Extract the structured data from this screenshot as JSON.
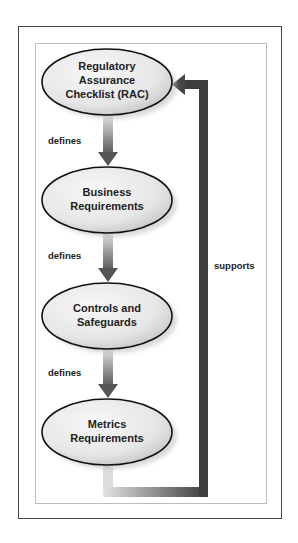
{
  "diagram": {
    "nodes": [
      {
        "id": "rac",
        "lines": [
          "Regulatory",
          "Assurance",
          "Checklist (RAC)"
        ]
      },
      {
        "id": "business",
        "lines": [
          "Business",
          "Requirements"
        ]
      },
      {
        "id": "controls",
        "lines": [
          "Controls and",
          "Safeguards"
        ]
      },
      {
        "id": "metrics",
        "lines": [
          "Metrics",
          "Requirements"
        ]
      }
    ],
    "edges": [
      {
        "from": "rac",
        "to": "business",
        "label": "defines"
      },
      {
        "from": "business",
        "to": "controls",
        "label": "defines"
      },
      {
        "from": "controls",
        "to": "metrics",
        "label": "defines"
      },
      {
        "from": "metrics",
        "to": "rac",
        "label": "supports"
      }
    ],
    "colors": {
      "node_fill_light": "#f4f4f4",
      "node_fill_dark": "#cfcfcf",
      "node_border": "#111111",
      "arrow_light": "#e0e0e0",
      "arrow_dark": "#555555"
    }
  }
}
